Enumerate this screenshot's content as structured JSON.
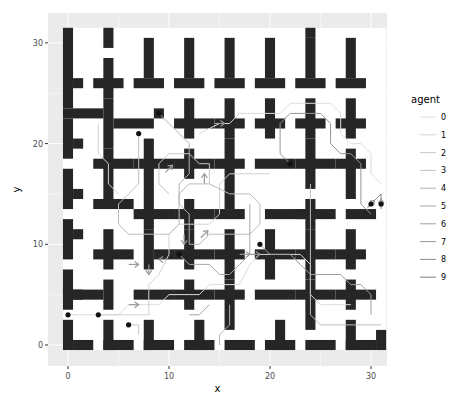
{
  "chart_data": {
    "type": "line",
    "title": "",
    "xlabel": "x",
    "ylabel": "y",
    "xlim": [
      -2,
      32
    ],
    "ylim": [
      -2.2,
      33
    ],
    "x_ticks": [
      0,
      10,
      20,
      30
    ],
    "y_ticks": [
      0,
      10,
      20,
      30
    ],
    "x_tick_labels": [
      "0",
      "10",
      "20",
      "30"
    ],
    "y_tick_labels": [
      "0",
      "10",
      "20",
      "30"
    ],
    "grid": true,
    "legend": {
      "title": "agent",
      "placement": "right",
      "entries": [
        "0",
        "1",
        "2",
        "3",
        "4",
        "5",
        "6",
        "7",
        "8",
        "9"
      ]
    },
    "series_colors": [
      "#dcdcdc",
      "#d2d2d2",
      "#c8c8c8",
      "#bdbdbd",
      "#b3b3b3",
      "#a9a9a9",
      "#9f9f9f",
      "#959595",
      "#8c8c8c",
      "#838383"
    ],
    "agent_starts": [
      {
        "agent": 0,
        "x": 0,
        "y": 3
      },
      {
        "agent": 1,
        "x": 3,
        "y": 3
      },
      {
        "agent": 2,
        "x": 6,
        "y": 2
      },
      {
        "agent": 3,
        "x": 7,
        "y": 21
      },
      {
        "agent": 4,
        "x": 9,
        "y": 23
      },
      {
        "agent": 5,
        "x": 11,
        "y": 9
      },
      {
        "agent": 6,
        "x": 19,
        "y": 10
      },
      {
        "agent": 7,
        "x": 22,
        "y": 18
      },
      {
        "agent": 8,
        "x": 30,
        "y": 14
      },
      {
        "agent": 9,
        "x": 31,
        "y": 14
      }
    ],
    "series": [
      {
        "name": "0",
        "points": [
          [
            0,
            3
          ],
          [
            5,
            3
          ],
          [
            6,
            4
          ],
          [
            9,
            4
          ],
          [
            10,
            5
          ],
          [
            13,
            5
          ],
          [
            14,
            6
          ],
          [
            17,
            6
          ],
          [
            18,
            8
          ],
          [
            19,
            9
          ],
          [
            23,
            9
          ],
          [
            24,
            8
          ],
          [
            24,
            5
          ],
          [
            25,
            4
          ],
          [
            28,
            4
          ]
        ]
      },
      {
        "name": "1",
        "points": [
          [
            3,
            3
          ],
          [
            8,
            3
          ],
          [
            8,
            6
          ],
          [
            9,
            7
          ],
          [
            10,
            9
          ],
          [
            10,
            11
          ],
          [
            11,
            12
          ],
          [
            14,
            12
          ],
          [
            15,
            13
          ],
          [
            15,
            16
          ],
          [
            16,
            17
          ],
          [
            20,
            17
          ]
        ]
      },
      {
        "name": "2",
        "points": [
          [
            6,
            2
          ],
          [
            7,
            2
          ],
          [
            7,
            1
          ]
        ]
      },
      {
        "name": "3",
        "points": [
          [
            7,
            21
          ],
          [
            7,
            16
          ],
          [
            6,
            15
          ],
          [
            5,
            14
          ],
          [
            5,
            12
          ],
          [
            6,
            11
          ],
          [
            10,
            11
          ],
          [
            11,
            12
          ],
          [
            11,
            15
          ],
          [
            12,
            16
          ],
          [
            14,
            16
          ],
          [
            16,
            15
          ],
          [
            18,
            15
          ],
          [
            19,
            14
          ],
          [
            19,
            12
          ],
          [
            18,
            11
          ],
          [
            14,
            11
          ]
        ]
      },
      {
        "name": "4",
        "points": [
          [
            9,
            23
          ],
          [
            10,
            22
          ],
          [
            11,
            21
          ],
          [
            12,
            20
          ],
          [
            12,
            17
          ],
          [
            11,
            16
          ],
          [
            11,
            14
          ],
          [
            12,
            13
          ],
          [
            12,
            10
          ],
          [
            13,
            10
          ],
          [
            14,
            11
          ]
        ]
      },
      {
        "name": "5",
        "points": [
          [
            11,
            9
          ],
          [
            12,
            8
          ],
          [
            14,
            8
          ],
          [
            15,
            7
          ],
          [
            16,
            7
          ],
          [
            17,
            8
          ],
          [
            18,
            9
          ],
          [
            18,
            11
          ],
          [
            18,
            14
          ]
        ]
      },
      {
        "name": "6",
        "points": [
          [
            19,
            10
          ],
          [
            20,
            9
          ],
          [
            22,
            9
          ],
          [
            23,
            8
          ],
          [
            24,
            7
          ],
          [
            27,
            7
          ],
          [
            28,
            6
          ],
          [
            29,
            6
          ],
          [
            30,
            5
          ],
          [
            30,
            3
          ]
        ]
      },
      {
        "name": "7",
        "points": [
          [
            22,
            18
          ],
          [
            21,
            19
          ],
          [
            21,
            22
          ],
          [
            22,
            23
          ],
          [
            25,
            23
          ],
          [
            26,
            22
          ],
          [
            26,
            20
          ],
          [
            27,
            19
          ],
          [
            28,
            19
          ],
          [
            29,
            18
          ],
          [
            29,
            14
          ],
          [
            30,
            13
          ]
        ]
      },
      {
        "name": "8",
        "points": [
          [
            30,
            14
          ],
          [
            31,
            15
          ]
        ]
      },
      {
        "name": "9",
        "points": [
          [
            31,
            14
          ],
          [
            31,
            15
          ]
        ]
      },
      {
        "name": "4b",
        "points": [
          [
            13,
            21
          ],
          [
            15,
            22
          ],
          [
            16,
            22
          ],
          [
            17,
            23
          ],
          [
            21,
            23
          ],
          [
            22,
            24
          ],
          [
            26,
            24
          ],
          [
            27,
            23
          ],
          [
            27,
            21
          ],
          [
            28,
            20
          ],
          [
            29,
            20
          ],
          [
            30,
            19
          ],
          [
            30,
            17
          ],
          [
            31,
            16
          ]
        ]
      },
      {
        "name": "3b",
        "points": [
          [
            3,
            22
          ],
          [
            3,
            19
          ],
          [
            4,
            18
          ],
          [
            4,
            16
          ],
          [
            5,
            15
          ]
        ]
      },
      {
        "name": "5b",
        "points": [
          [
            14,
            16
          ],
          [
            14,
            18
          ],
          [
            13,
            18
          ],
          [
            12,
            19
          ],
          [
            10,
            19
          ],
          [
            9,
            18
          ],
          [
            9,
            16
          ],
          [
            10,
            15
          ]
        ]
      },
      {
        "name": "6b",
        "points": [
          [
            24,
            16
          ],
          [
            24,
            3
          ],
          [
            25,
            2
          ],
          [
            31,
            2
          ]
        ]
      },
      {
        "name": "1b",
        "points": [
          [
            16,
            4
          ],
          [
            16,
            2
          ],
          [
            15,
            1
          ],
          [
            15,
            0
          ]
        ]
      },
      {
        "name": "2b",
        "points": [
          [
            12,
            3
          ],
          [
            13,
            3
          ],
          [
            14,
            4
          ]
        ]
      }
    ],
    "arrows": [
      {
        "x": 15,
        "y": 22,
        "dx": 1,
        "dy": 0
      },
      {
        "x": 10,
        "y": 17.5,
        "dx": 1,
        "dy": 1
      },
      {
        "x": 13.5,
        "y": 16.5,
        "dx": 0,
        "dy": 1
      },
      {
        "x": 11.5,
        "y": 10.5,
        "dx": 0,
        "dy": -1
      },
      {
        "x": 13.5,
        "y": 11,
        "dx": 1,
        "dy": 1
      },
      {
        "x": 17.5,
        "y": 9,
        "dx": 1,
        "dy": 0
      },
      {
        "x": 18.5,
        "y": 9,
        "dx": 1,
        "dy": 0
      },
      {
        "x": 8,
        "y": 7.5,
        "dx": 0,
        "dy": -1
      },
      {
        "x": 9.5,
        "y": 8.5,
        "dx": -1,
        "dy": 0
      },
      {
        "x": 30,
        "y": 14,
        "dx": 1,
        "dy": 1
      },
      {
        "x": 31,
        "y": 14,
        "dx": 0,
        "dy": 1
      },
      {
        "x": 6.5,
        "y": 4,
        "dx": 1,
        "dy": 0
      },
      {
        "x": 6.5,
        "y": 8,
        "dx": 1,
        "dy": 0
      }
    ]
  }
}
